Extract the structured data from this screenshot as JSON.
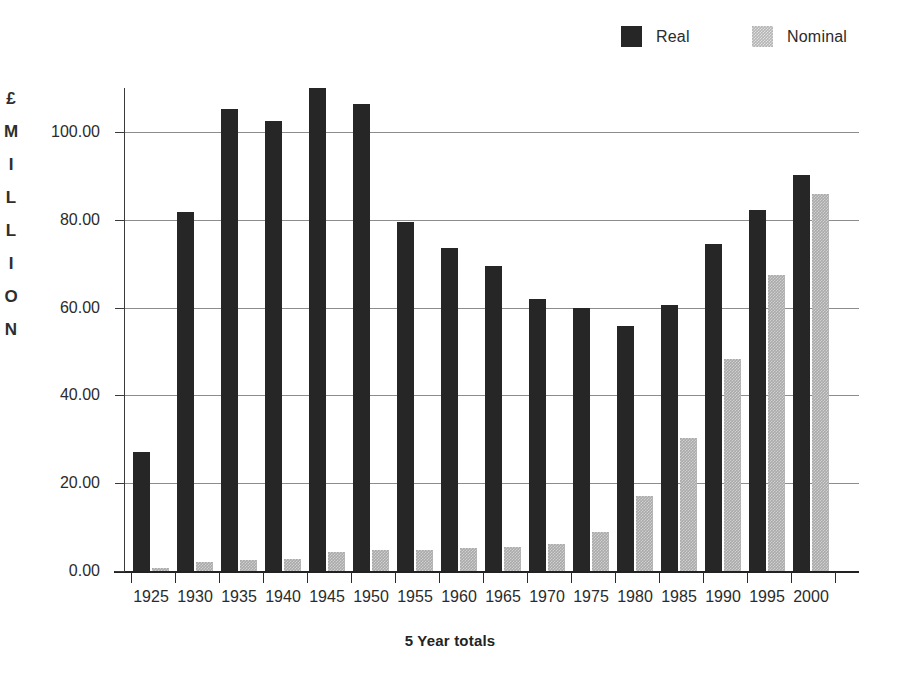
{
  "chart_data": {
    "type": "bar",
    "title": "",
    "xlabel": "5 Year totals",
    "ylabel": "£ MILLION",
    "ylim": [
      0,
      110
    ],
    "ytick_labels": [
      "0.00",
      "20.00",
      "40.00",
      "60.00",
      "80.00",
      "100.00"
    ],
    "ytick_values": [
      0,
      20,
      40,
      60,
      80,
      100
    ],
    "grid": true,
    "legend_position": "top-right",
    "categories": [
      "1925",
      "1930",
      "1935",
      "1940",
      "1945",
      "1950",
      "1955",
      "1960",
      "1965",
      "1970",
      "1975",
      "1980",
      "1985",
      "1990",
      "1995",
      "2000"
    ],
    "series": [
      {
        "name": "Real",
        "color": "#262626",
        "values": [
          27.0,
          81.8,
          105.2,
          102.4,
          110.0,
          106.4,
          79.5,
          73.5,
          69.5,
          62.0,
          59.8,
          55.8,
          60.6,
          74.5,
          82.3,
          90.2
        ]
      },
      {
        "name": "Nominal",
        "color": "#a9a9a9",
        "values": [
          0.8,
          2.0,
          2.5,
          2.8,
          4.3,
          4.8,
          4.7,
          5.3,
          5.5,
          6.2,
          8.8,
          17.0,
          30.3,
          48.2,
          67.5,
          85.8
        ]
      }
    ]
  },
  "legend": {
    "entries": [
      {
        "label": "Real",
        "swatch": "real-swatch"
      },
      {
        "label": "Nominal",
        "swatch": "nominal-swatch"
      }
    ]
  },
  "axes": {
    "y_title_letters": [
      "£",
      "M",
      "I",
      "L",
      "L",
      "I",
      "O",
      "N"
    ],
    "x_title": "5 Year totals"
  }
}
